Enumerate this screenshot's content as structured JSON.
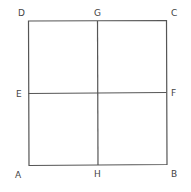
{
  "diagram": {
    "type": "square divided into four quadrants",
    "stroke_color": "#555555",
    "labels": {
      "D": "D",
      "G": "G",
      "C": "C",
      "E": "E",
      "F": "F",
      "A": "A",
      "H": "H",
      "B": "B"
    }
  }
}
